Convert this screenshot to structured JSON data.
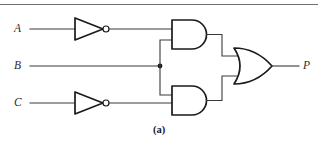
{
  "figure": {
    "caption": "(a)",
    "type": "logic-circuit-diagram"
  },
  "inputs": [
    {
      "id": "A",
      "label": "A",
      "y": 29
    },
    {
      "id": "B",
      "label": "B",
      "y": 66
    },
    {
      "id": "C",
      "label": "C",
      "y": 103
    }
  ],
  "output": {
    "id": "P",
    "label": "P",
    "y": 66
  },
  "gates": [
    {
      "id": "inv-a",
      "type": "NOT",
      "inputs": [
        "A"
      ],
      "output": "notA"
    },
    {
      "id": "inv-c",
      "type": "NOT",
      "inputs": [
        "C"
      ],
      "output": "notC"
    },
    {
      "id": "and-top",
      "type": "AND",
      "inputs": [
        "notA",
        "B"
      ],
      "output": "t1"
    },
    {
      "id": "and-bottom",
      "type": "AND",
      "inputs": [
        "B",
        "notC"
      ],
      "output": "t2"
    },
    {
      "id": "or-out",
      "type": "OR",
      "inputs": [
        "t1",
        "t2"
      ],
      "output": "P"
    }
  ],
  "junctions": [
    {
      "id": "b-fanout",
      "net": "B",
      "x": 160,
      "y": 66
    }
  ],
  "colors": {
    "wire": "#3a3a3a",
    "gate_outline": "#1a1a1a",
    "background": "#ffffff",
    "rule": "#6f6f6f",
    "text": "#2b2b2b"
  }
}
